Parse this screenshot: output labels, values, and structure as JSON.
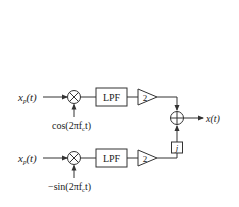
{
  "top_path": {
    "input_label": "x_p(t)",
    "input_main": "x",
    "input_sub": "p",
    "input_tail": "(t)",
    "carrier_label": "cos(2πf_c t)",
    "carrier_pre": "cos(2πf",
    "carrier_sub": "c",
    "carrier_post": "t)",
    "filter_label": "LPF",
    "gain_label": "2"
  },
  "bottom_path": {
    "input_label": "x_p(t)",
    "input_main": "x",
    "input_sub": "p",
    "input_tail": "(t)",
    "carrier_label": "−sin(2πf_c t)",
    "carrier_pre": "−sin(2πf",
    "carrier_sub": "c",
    "carrier_post": "t)",
    "filter_label": "LPF",
    "gain_label": "2",
    "multiplier_label": "j"
  },
  "output": {
    "label": "x(t)"
  },
  "colors": {
    "stroke": "#333333",
    "text": "#222222",
    "background": "#ffffff"
  }
}
